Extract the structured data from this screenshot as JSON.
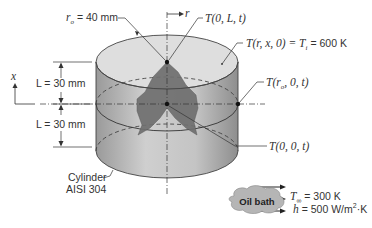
{
  "figure": {
    "labels": {
      "radius": "r",
      "radius_value": " = 40 mm",
      "radius_sub": "o",
      "r_axis": "r",
      "x_axis": "x",
      "top_center": "T(0, L, t)",
      "initial": "T(r, x, 0) = T",
      "initial_sub": "i",
      "initial_value": " = 600 K",
      "surface_mid": "T(r",
      "surface_mid_sub": "o",
      "surface_mid_end": ", 0, t)",
      "center": "T(0, 0, t)",
      "half_length_upper": "L = 30 mm",
      "half_length_lower": "L = 30 mm",
      "material_line1": "Cylinder",
      "material_line2": "AISI 304"
    },
    "environment": {
      "name": "Oil bath",
      "T_inf_label": "T",
      "T_inf_sub": "∞",
      "T_inf_value": " = 300 K",
      "h_label": "h",
      "h_value": " = 500 W/m",
      "h_exp": "2",
      "h_unit": "·K"
    },
    "colors": {
      "cylinder_side": "#b9b9b9",
      "cylinder_top": "#dcdcdc",
      "section": "#6e6e6e",
      "outline": "#444444"
    }
  }
}
